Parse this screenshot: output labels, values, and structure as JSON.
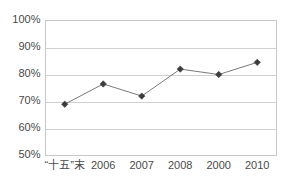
{
  "chart_data": {
    "type": "line",
    "title": "",
    "xlabel": "",
    "ylabel": "",
    "categories": [
      "“十五”末",
      "2006",
      "2007",
      "2008",
      "2000",
      "2010"
    ],
    "values": [
      69,
      76.5,
      72,
      82,
      80,
      84.5
    ],
    "series": [
      {
        "name": "",
        "values": [
          69,
          76.5,
          72,
          82,
          80,
          84.5
        ]
      }
    ],
    "ylim": [
      50,
      100
    ],
    "ytick_values": [
      50,
      60,
      70,
      80,
      90,
      100
    ],
    "ytick_labels": [
      "50%",
      "60%",
      "70%",
      "80%",
      "90%",
      "100%"
    ],
    "grid": "horizontal",
    "legend": "none",
    "marker": "diamond",
    "colors": {
      "line": "#7a7a7a",
      "marker": "#3c3c3c",
      "gridline": "#d0d0d0",
      "border": "#c8c8c8",
      "background": "#ffffff",
      "text": "#4a4a4a"
    }
  }
}
